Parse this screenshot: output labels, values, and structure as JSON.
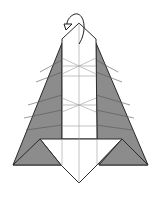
{
  "diagram": {
    "type": "origami-fold-step",
    "colors": {
      "paper_front": "#ffffff",
      "paper_back": "#8c8c8c",
      "line": "#2a2a2a",
      "crease": "#9a9a9a"
    },
    "annotations": [
      {
        "kind": "turn-over-arrow",
        "position": "top"
      }
    ],
    "caption": ""
  }
}
